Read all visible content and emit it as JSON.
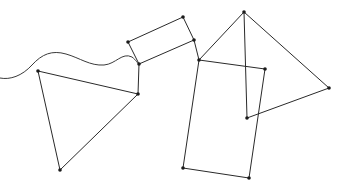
{
  "diagram": {
    "colors": {
      "line": "#2a2a2a",
      "vertex": "#1a1a1a",
      "background": "#ffffff"
    },
    "curve": {
      "path": "M0,78 C10,80 22,76 32,65 C42,54 52,50 66,54 C80,58 90,66 104,65 C116,64 122,52 132,57 C136,60 138,64 139,64"
    },
    "vertices": [
      {
        "id": "a",
        "x": 128,
        "y": 42
      },
      {
        "id": "b",
        "x": 183,
        "y": 17
      },
      {
        "id": "c",
        "x": 194,
        "y": 40
      },
      {
        "id": "d",
        "x": 139,
        "y": 64
      },
      {
        "id": "e",
        "x": 38,
        "y": 71
      },
      {
        "id": "f",
        "x": 138,
        "y": 94
      },
      {
        "id": "g",
        "x": 60,
        "y": 170
      },
      {
        "id": "h",
        "x": 199,
        "y": 60
      },
      {
        "id": "i",
        "x": 265,
        "y": 69
      },
      {
        "id": "j",
        "x": 249,
        "y": 178
      },
      {
        "id": "k",
        "x": 183,
        "y": 168
      },
      {
        "id": "l",
        "x": 244,
        "y": 12
      },
      {
        "id": "m",
        "x": 329,
        "y": 88
      },
      {
        "id": "n",
        "x": 247,
        "y": 118
      }
    ],
    "edges": [
      [
        "a",
        "b"
      ],
      [
        "b",
        "c"
      ],
      [
        "c",
        "d"
      ],
      [
        "d",
        "a"
      ],
      [
        "e",
        "f"
      ],
      [
        "f",
        "g"
      ],
      [
        "g",
        "e"
      ],
      [
        "d",
        "f"
      ],
      [
        "c",
        "h"
      ],
      [
        "h",
        "i"
      ],
      [
        "i",
        "j"
      ],
      [
        "j",
        "k"
      ],
      [
        "k",
        "h"
      ],
      [
        "h",
        "l"
      ],
      [
        "l",
        "m"
      ],
      [
        "m",
        "n"
      ],
      [
        "n",
        "l"
      ]
    ]
  }
}
